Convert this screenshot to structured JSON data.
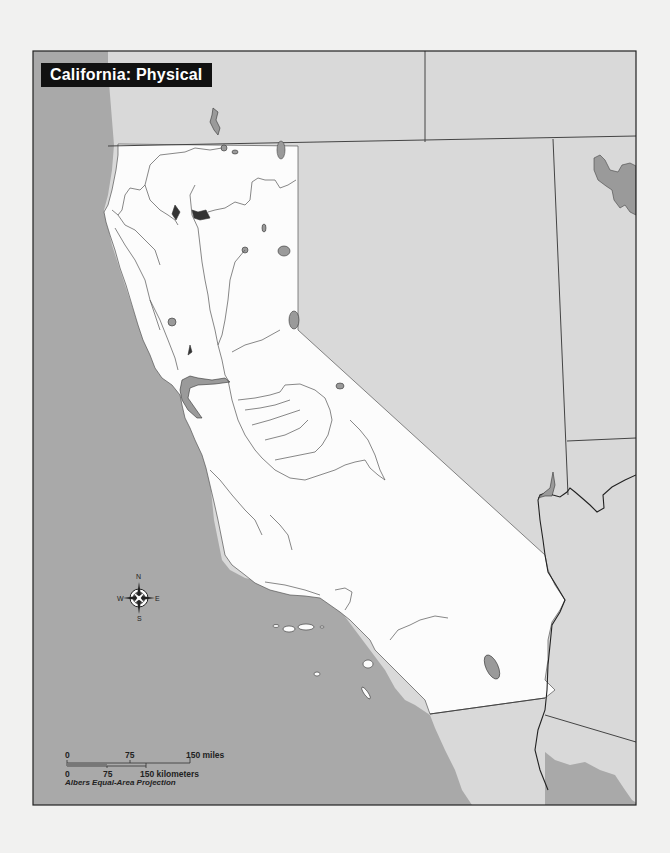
{
  "map": {
    "title": "California: Physical",
    "colors": {
      "page_background": "#f1f1f0",
      "ocean": "#a9a9a9",
      "california_land": "#fcfcfc",
      "neighbor_land": "#d9d9d9",
      "lake": "#9a9a9a",
      "river": "#555555",
      "border": "#444444",
      "title_bg": "#111111",
      "title_text": "#ffffff"
    },
    "compass": {
      "north": "N",
      "south": "S",
      "east": "E",
      "west": "W"
    },
    "scale_bar": {
      "miles": {
        "start": "0",
        "mid": "75",
        "end": "150 miles"
      },
      "kilometers": {
        "start": "0",
        "mid": "75",
        "end": "150 kilometers"
      }
    },
    "projection": "Albers Equal-Area Projection"
  }
}
